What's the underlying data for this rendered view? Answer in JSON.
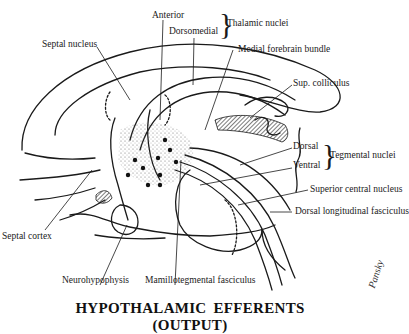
{
  "figure": {
    "title": "HYPOTHALAMIC  EFFERENTS (OUTPUT)",
    "signature": "Pansky",
    "colors": {
      "ink": "#1a1a1a",
      "background": "#ffffff",
      "stipple": "#555555"
    }
  },
  "labels": {
    "anterior": "Anterior",
    "dorsomedial": "Dorsomedial",
    "thalamic_nuclei": "Thalamic nuclei",
    "septal_nucleus": "Septal nucleus",
    "medial_forebrain_bundle": "Medial forebrain bundle",
    "sup_colliculus": "Sup. colliculus",
    "dorsal": "Dorsal",
    "ventral": "Ventral",
    "tegmental_nuclei": "Tegmental nuclei",
    "superior_central_nucleus": "Superior central nucleus",
    "dorsal_longitudinal_fasciculus": "Dorsal longitudinal fasciculus",
    "septal_cortex": "Septal cortex",
    "neurohypophysis": "Neurohypophysis",
    "mamillotegmental_fasciculus": "Mamillotegmental fasciculus"
  },
  "groups": {
    "thalamic_nuclei": [
      "Anterior",
      "Dorsomedial"
    ],
    "tegmental_nuclei": [
      "Dorsal",
      "Ventral"
    ]
  },
  "braces": {
    "symbol": "}"
  }
}
